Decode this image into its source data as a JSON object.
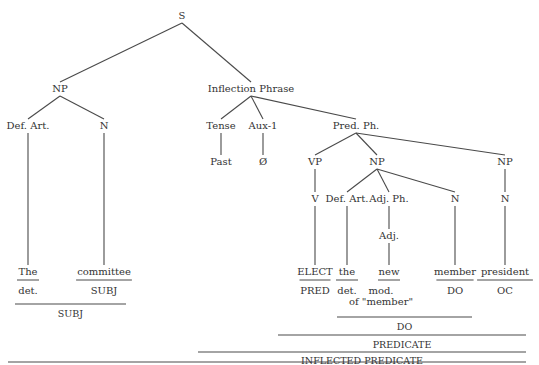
{
  "diagram": {
    "type": "syntax-tree",
    "nodes": [
      {
        "id": "S",
        "label": "S",
        "x": 182,
        "y": 10
      },
      {
        "id": "NP1",
        "label": "NP",
        "x": 60,
        "y": 83
      },
      {
        "id": "IP",
        "label": "Inflection Phrase",
        "x": 251,
        "y": 83
      },
      {
        "id": "DefArt1",
        "label": "Def. Art.",
        "x": 28,
        "y": 120
      },
      {
        "id": "N1",
        "label": "N",
        "x": 104,
        "y": 120
      },
      {
        "id": "Tense",
        "label": "Tense",
        "x": 221,
        "y": 120
      },
      {
        "id": "Aux1",
        "label": "Aux-1",
        "x": 263,
        "y": 120
      },
      {
        "id": "PredPh",
        "label": "Pred. Ph.",
        "x": 356,
        "y": 120
      },
      {
        "id": "Past",
        "label": "Past",
        "x": 221,
        "y": 156
      },
      {
        "id": "Null",
        "label": "Ø",
        "x": 263,
        "y": 156
      },
      {
        "id": "VP",
        "label": "VP",
        "x": 315,
        "y": 156
      },
      {
        "id": "NP2",
        "label": "NP",
        "x": 377,
        "y": 156
      },
      {
        "id": "NP3",
        "label": "NP",
        "x": 505,
        "y": 156
      },
      {
        "id": "V",
        "label": "V",
        "x": 315,
        "y": 193
      },
      {
        "id": "DefArt2",
        "label": "Def. Art.",
        "x": 347,
        "y": 193
      },
      {
        "id": "AdjPh",
        "label": "Adj. Ph.",
        "x": 389,
        "y": 193
      },
      {
        "id": "N2",
        "label": "N",
        "x": 455,
        "y": 193
      },
      {
        "id": "N3",
        "label": "N",
        "x": 505,
        "y": 193
      },
      {
        "id": "Adj",
        "label": "Adj.",
        "x": 389,
        "y": 230
      }
    ],
    "edges": [
      [
        "S",
        "NP1"
      ],
      [
        "S",
        "IP"
      ],
      [
        "NP1",
        "DefArt1"
      ],
      [
        "NP1",
        "N1"
      ],
      [
        "IP",
        "Tense"
      ],
      [
        "IP",
        "Aux1"
      ],
      [
        "IP",
        "PredPh"
      ],
      [
        "Tense",
        "Past"
      ],
      [
        "Aux1",
        "Null"
      ],
      [
        "PredPh",
        "VP"
      ],
      [
        "PredPh",
        "NP2"
      ],
      [
        "PredPh",
        "NP3"
      ],
      [
        "VP",
        "V"
      ],
      [
        "NP2",
        "DefArt2"
      ],
      [
        "NP2",
        "AdjPh"
      ],
      [
        "NP2",
        "N2"
      ],
      [
        "NP3",
        "N3"
      ],
      [
        "AdjPh",
        "Adj"
      ]
    ],
    "leaves": [
      {
        "word": "The",
        "x": 28,
        "parent": "DefArt1",
        "role": "det.",
        "role_x": 28
      },
      {
        "word": "committee",
        "x": 104,
        "parent": "N1",
        "role": "SUBJ",
        "role_x": 104
      },
      {
        "word": "ELECT",
        "x": 315,
        "parent": "V",
        "role": "PRED",
        "role_x": 315
      },
      {
        "word": "the",
        "x": 347,
        "parent": "DefArt2",
        "role": "det.",
        "role_x": 347
      },
      {
        "word": "new",
        "x": 389,
        "parent": "Adj",
        "role": "mod.",
        "role_x": 381,
        "role2": "of \"member\"",
        "role2_x": 381
      },
      {
        "word": "member",
        "x": 455,
        "parent": "N2",
        "role": "DO",
        "role_x": 455
      },
      {
        "word": "president",
        "x": 505,
        "parent": "N3",
        "role": "OC",
        "role_x": 505
      }
    ],
    "word_y": 266,
    "role_y": 285,
    "brackets": [
      {
        "label": "SUBJ",
        "x1": 15,
        "x2": 126,
        "y": 304,
        "label_y": 308
      },
      {
        "label": "DO",
        "x1": 337,
        "x2": 472,
        "y": 317,
        "label_y": 321
      },
      {
        "label": "PREDICATE",
        "x1": 278,
        "x2": 526,
        "y": 335,
        "label_y": 339
      },
      {
        "label": "INFLECTED PREDICATE",
        "x1": 198,
        "x2": 526,
        "y": 352,
        "label_y": 355
      }
    ],
    "bottom_rule": {
      "x1": 8,
      "x2": 526,
      "y": 352
    },
    "colors": {
      "line": "#4a4a4a",
      "text": "#333333",
      "background": "#ffffff"
    }
  }
}
